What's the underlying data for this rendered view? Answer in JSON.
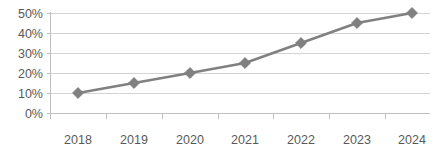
{
  "chart_data": {
    "type": "line",
    "title": "",
    "subtitle": "",
    "xlabel": "",
    "ylabel": "",
    "categories": [
      "2018",
      "2019",
      "2020",
      "2021",
      "2022",
      "2023",
      "2024"
    ],
    "values": [
      10,
      15,
      20,
      25,
      35,
      45,
      50
    ],
    "value_labels": [
      "10%",
      "15%",
      "20%",
      "25%",
      "35%",
      "45%",
      "50%"
    ],
    "series": [
      {
        "name": "Series 1",
        "values": [
          10,
          15,
          20,
          25,
          35,
          45,
          50
        ],
        "color": "#808080",
        "marker": "diamond"
      }
    ],
    "ylim": [
      0,
      50
    ],
    "ytick_values": [
      0,
      10,
      20,
      30,
      40,
      50
    ],
    "ytick_labels": [
      "0%",
      "10%",
      "20%",
      "30%",
      "40%",
      "50%"
    ],
    "xtick_labels": [
      "2018",
      "2019",
      "2020",
      "2021",
      "2022",
      "2023",
      "2024"
    ],
    "grid": true,
    "grid_axis": "y",
    "grid_color": "#d4d4d4",
    "legend": false,
    "legend_position": "none",
    "background_color": "#ffffff",
    "axis_color": "#bfbfbf",
    "tick_label_color": "#595959"
  },
  "axes": {
    "y_labels": [
      {
        "text": "50%",
        "y": 13
      },
      {
        "text": "40%",
        "y": 33
      },
      {
        "text": "30%",
        "y": 53
      },
      {
        "text": "20%",
        "y": 73
      },
      {
        "text": "10%",
        "y": 93
      },
      {
        "text": "0%",
        "y": 113
      }
    ],
    "x_labels": [
      {
        "text": "2018",
        "x": 78
      },
      {
        "text": "2019",
        "x": 134
      },
      {
        "text": "2020",
        "x": 190
      },
      {
        "text": "2021",
        "x": 245
      },
      {
        "text": "2022",
        "x": 301
      },
      {
        "text": "2023",
        "x": 357
      },
      {
        "text": "2024",
        "x": 412
      }
    ]
  }
}
